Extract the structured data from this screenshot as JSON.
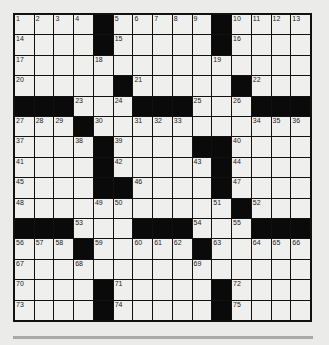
{
  "puzzle": {
    "rows": 15,
    "cols": 15,
    "grid": [
      [
        "1",
        "2",
        "3",
        "4",
        "#",
        "5",
        "6",
        "7",
        "8",
        "9",
        "#",
        "10",
        "11",
        "12",
        "13"
      ],
      [
        "14",
        "",
        "",
        "",
        "#",
        "15",
        "",
        "",
        "",
        "",
        "#",
        "16",
        "",
        "",
        ""
      ],
      [
        "17",
        "",
        "",
        "",
        "18",
        "",
        "",
        "",
        "",
        "",
        "19",
        "",
        "",
        "",
        ""
      ],
      [
        "20",
        "",
        "",
        "",
        "",
        "#",
        "21",
        "",
        "",
        "",
        "",
        "#",
        "22",
        "",
        ""
      ],
      [
        "#",
        "#",
        "#",
        "23",
        "",
        "24",
        "#",
        "#",
        "#",
        "25",
        "",
        "26",
        "#",
        "#",
        "#"
      ],
      [
        "27",
        "28",
        "29",
        "#",
        "30",
        "",
        "31",
        "32",
        "33",
        "",
        "",
        "",
        "34",
        "35",
        "36"
      ],
      [
        "37",
        "",
        "",
        "38",
        "#",
        "39",
        "",
        "",
        "",
        "#",
        "#",
        "40",
        "",
        "",
        ""
      ],
      [
        "41",
        "",
        "",
        "",
        "#",
        "42",
        "",
        "",
        "",
        "43",
        "#",
        "44",
        "",
        "",
        ""
      ],
      [
        "45",
        "",
        "",
        "",
        "#",
        "#",
        "46",
        "",
        "",
        "",
        "#",
        "47",
        "",
        "",
        ""
      ],
      [
        "48",
        "",
        "",
        "",
        "49",
        "50",
        "",
        "",
        "",
        "",
        "51",
        "#",
        "52",
        "",
        ""
      ],
      [
        "#",
        "#",
        "#",
        "53",
        "",
        "",
        "#",
        "#",
        "#",
        "54",
        "",
        "55",
        "#",
        "#",
        "#"
      ],
      [
        "56",
        "57",
        "58",
        "#",
        "59",
        "",
        "60",
        "61",
        "62",
        "#",
        "63",
        "",
        "64",
        "65",
        "66"
      ],
      [
        "67",
        "",
        "",
        "68",
        "",
        "",
        "",
        "",
        "",
        "69",
        "",
        "",
        "",
        "",
        ""
      ],
      [
        "70",
        "",
        "",
        "",
        "#",
        "71",
        "",
        "",
        "",
        "",
        "#",
        "72",
        "",
        "",
        ""
      ],
      [
        "73",
        "",
        "",
        "",
        "#",
        "74",
        "",
        "",
        "",
        "",
        "#",
        "75",
        "",
        "",
        ""
      ]
    ]
  },
  "colors": {
    "block": "#0a0a0a",
    "cell": "#efefee",
    "line": "#111111",
    "page": "#ebebea",
    "divider": "#a9a9a9"
  }
}
